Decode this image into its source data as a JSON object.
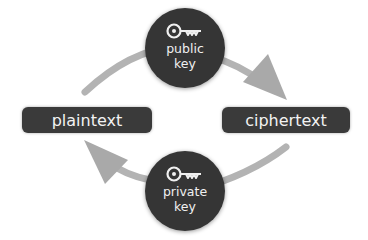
{
  "diagram": {
    "nodes": {
      "plaintext": {
        "label": "plaintext"
      },
      "ciphertext": {
        "label": "ciphertext"
      },
      "public_key": {
        "line1": "public",
        "line2": "key",
        "icon": "key-icon"
      },
      "private_key": {
        "line1": "private",
        "line2": "key",
        "icon": "key-icon"
      }
    },
    "edges": [
      {
        "from": "plaintext",
        "to": "ciphertext",
        "via": "public_key",
        "direction": "clockwise-top"
      },
      {
        "from": "ciphertext",
        "to": "plaintext",
        "via": "private_key",
        "direction": "clockwise-bottom"
      }
    ],
    "colors": {
      "node_fill": "#353535",
      "arrow": "#b3b3b3",
      "text": "#f0f0f0",
      "background": "#ffffff"
    }
  }
}
